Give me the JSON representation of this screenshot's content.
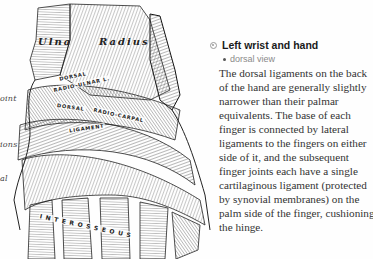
{
  "illustration": {
    "alt": "Engraving of the dorsal ligaments of the left wrist and hand",
    "bone_labels": {
      "ulna": "Ulna",
      "radius": "Radius"
    },
    "ligament_labels": {
      "dorsal_radio_ulnar_1": "DORSAL",
      "dorsal_radio_ulnar_2": "RADIO-ULNAR L.",
      "dorsal_radio_carpal_1": "DORSAL",
      "dorsal_radio_carpal_2": "RADIO-CARPAL",
      "dorsal_radio_carpal_3": "LIGAMENT",
      "interosseous": "I N T E R O S S E O U S"
    },
    "side_labels": {
      "joint": "oint",
      "articulations": "ions",
      "dorsal": "al"
    }
  },
  "info": {
    "bullet_icon": "circle-bullet-icon",
    "title": "Left wrist and hand",
    "subtitle": "dorsal view",
    "body": "The dorsal ligaments on the back of the hand are generally slightly narrower than their palmar equivalents. The base of each finger is connected by lateral ligaments to the fingers on either side of it, and the subsequent finger joints each have a single cartilaginous ligament (protected by synovial membranes) on the palm side of the finger, cushioning the hinge."
  },
  "colors": {
    "title": "#1a1a1a",
    "subtitle": "#8a8a8a",
    "body": "#333333",
    "bullet": "#9a9a9a",
    "engraving": "#2a2a2a"
  }
}
